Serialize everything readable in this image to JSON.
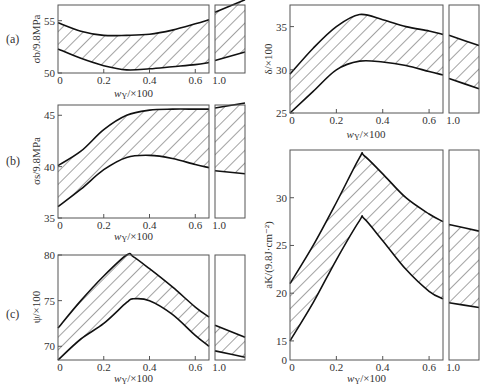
{
  "figure": {
    "panel_labels": [
      "(a)",
      "(b)",
      "(c)"
    ],
    "xlabel": "w_Y/×100",
    "xticks_main": [
      "0",
      "0.2",
      "0.4",
      "0.6"
    ],
    "xtick_break": "1.0"
  },
  "chart_data": [
    {
      "type": "area",
      "panel": "(a)",
      "title": "",
      "xlabel": "w_Y/×100",
      "ylabel": "σ_b/9.8MPa",
      "yticks": [
        "50",
        "55"
      ],
      "ylim": [
        50,
        56.5
      ],
      "x": [
        0,
        0.1,
        0.2,
        0.3,
        0.4,
        0.5,
        0.6,
        0.66,
        1.0,
        1.15
      ],
      "series": [
        {
          "name": "upper bound",
          "values": [
            54.8,
            54.0,
            53.6,
            53.6,
            53.7,
            54.1,
            54.7,
            55.1,
            55.8,
            57.0
          ]
        },
        {
          "name": "lower bound",
          "values": [
            52.3,
            51.4,
            50.7,
            50.3,
            50.4,
            50.6,
            50.8,
            51.0,
            51.2,
            52.0
          ]
        }
      ]
    },
    {
      "type": "area",
      "panel": "(b)",
      "xlabel": "w_Y/×100",
      "ylabel": "σ_s/9.8MPa",
      "yticks": [
        "35",
        "40",
        "45"
      ],
      "ylim": [
        35,
        46
      ],
      "x": [
        0,
        0.1,
        0.2,
        0.3,
        0.4,
        0.5,
        0.6,
        0.66,
        1.0,
        1.15
      ],
      "series": [
        {
          "name": "upper bound",
          "values": [
            40.1,
            41.5,
            43.6,
            45.0,
            45.5,
            45.6,
            45.6,
            45.6,
            45.7,
            46.2
          ]
        },
        {
          "name": "lower bound",
          "values": [
            36.1,
            37.8,
            39.7,
            40.9,
            41.1,
            40.8,
            40.2,
            39.9,
            39.6,
            39.3
          ]
        }
      ]
    },
    {
      "type": "area",
      "panel": "(c)",
      "xlabel": "w_Y/×100",
      "ylabel": "ψ/×100",
      "yticks": [
        "70",
        "75",
        "80"
      ],
      "ylim": [
        68.5,
        80
      ],
      "x": [
        0,
        0.1,
        0.2,
        0.3,
        0.33,
        0.4,
        0.5,
        0.6,
        0.66,
        1.0,
        1.15
      ],
      "series": [
        {
          "name": "upper bound",
          "values": [
            72.0,
            75.0,
            77.7,
            80.0,
            79.8,
            78.5,
            76.5,
            74.3,
            73.2,
            72.3,
            71.0
          ]
        },
        {
          "name": "lower bound",
          "values": [
            68.5,
            70.8,
            72.5,
            74.8,
            75.2,
            75.0,
            73.5,
            71.2,
            70.0,
            69.5,
            68.8
          ]
        }
      ]
    },
    {
      "type": "area",
      "panel": "δ",
      "xlabel": "w_Y/×100",
      "ylabel": "δ/×100",
      "yticks": [
        "25",
        "30",
        "35"
      ],
      "ylim": [
        25,
        37.5
      ],
      "x": [
        0,
        0.1,
        0.2,
        0.3,
        0.4,
        0.5,
        0.6,
        0.66,
        1.0,
        1.15
      ],
      "series": [
        {
          "name": "upper bound",
          "values": [
            29.5,
            32.5,
            35.0,
            36.4,
            35.8,
            35.0,
            34.5,
            34.1,
            34.0,
            32.8
          ]
        },
        {
          "name": "lower bound",
          "values": [
            25.0,
            27.5,
            30.0,
            31.0,
            30.9,
            30.5,
            29.8,
            29.4,
            29.0,
            27.8
          ]
        }
      ]
    },
    {
      "type": "area",
      "panel": "aK",
      "xlabel": "w_Y/×100",
      "ylabel": "a_K/(9.8J·cm⁻²)",
      "yticks": [
        "0",
        "15",
        "20",
        "25",
        "30"
      ],
      "ylim": [
        13,
        35
      ],
      "x": [
        0,
        0.1,
        0.2,
        0.3,
        0.32,
        0.4,
        0.5,
        0.6,
        0.66,
        1.0,
        1.15
      ],
      "series": [
        {
          "name": "upper bound",
          "values": [
            21.0,
            25.0,
            29.5,
            34.2,
            34.4,
            32.5,
            30.0,
            28.3,
            27.5,
            27.2,
            26.5
          ]
        },
        {
          "name": "lower bound",
          "values": [
            15.0,
            19.0,
            23.5,
            27.6,
            27.8,
            25.5,
            22.5,
            20.2,
            19.4,
            19.0,
            18.5
          ]
        }
      ]
    }
  ]
}
